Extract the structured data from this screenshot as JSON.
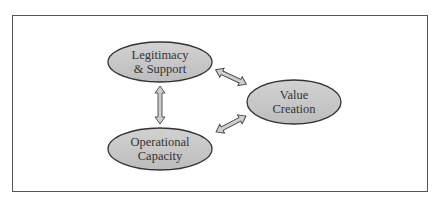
{
  "caption_cut": "Figure: Strategic Triangle",
  "nodes": [
    {
      "id": "legitimacy",
      "line1": "Legitimacy",
      "line2": "& Support"
    },
    {
      "id": "value",
      "line1": "Value",
      "line2": "Creation"
    },
    {
      "id": "operational",
      "line1": "Operational",
      "line2": "Capacity"
    }
  ],
  "colors": {
    "ellipse_fill": "#c8c8c8",
    "stroke": "#333333",
    "arrow_fill": "#cfcfcf",
    "frame": "#555555"
  }
}
